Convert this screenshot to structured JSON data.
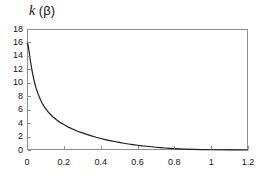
{
  "chart_data": {
    "type": "line",
    "title": "",
    "ylabel_parts": {
      "symbol": "k",
      "arg": " (β)"
    },
    "ylabel": "k (β)",
    "xlabel": "β",
    "xlim": [
      0,
      1.2
    ],
    "ylim": [
      0,
      18
    ],
    "grid": false,
    "legend": null,
    "xticks": [
      "0",
      "0.2",
      "0.4",
      "0.6",
      "0.8",
      "1",
      "1.2"
    ],
    "xtick_values": [
      0,
      0.2,
      0.4,
      0.6,
      0.8,
      1,
      1.2
    ],
    "yticks": [
      "0",
      "2",
      "4",
      "6",
      "8",
      "10",
      "12",
      "14",
      "16",
      "18"
    ],
    "ytick_values": [
      0,
      2,
      4,
      6,
      8,
      10,
      12,
      14,
      16,
      18
    ],
    "series": [
      {
        "name": "k(β)",
        "color": "#1a1a1a",
        "x": [
          0.0,
          0.005,
          0.01,
          0.015,
          0.02,
          0.03,
          0.04,
          0.05,
          0.06,
          0.07,
          0.08,
          0.09,
          0.1,
          0.12,
          0.14,
          0.16,
          0.18,
          0.2,
          0.225,
          0.25,
          0.275,
          0.3,
          0.325,
          0.35,
          0.375,
          0.4,
          0.425,
          0.45,
          0.475,
          0.5,
          0.525,
          0.55,
          0.575,
          0.6,
          0.625,
          0.65,
          0.675,
          0.7,
          0.725,
          0.75,
          0.775,
          0.8,
          0.85,
          0.9,
          0.95,
          1.0,
          1.1,
          1.2
        ],
        "y": [
          15.8,
          15.75,
          14.9,
          13.9,
          13.0,
          11.4,
          10.15,
          9.15,
          8.35,
          7.7,
          7.1,
          6.6,
          6.2,
          5.5,
          4.95,
          4.5,
          4.1,
          3.78,
          3.4,
          3.08,
          2.8,
          2.55,
          2.32,
          2.1,
          1.9,
          1.72,
          1.55,
          1.4,
          1.26,
          1.13,
          1.01,
          0.9,
          0.8,
          0.71,
          0.62,
          0.55,
          0.48,
          0.41,
          0.35,
          0.3,
          0.25,
          0.21,
          0.14,
          0.09,
          0.06,
          0.04,
          0.015,
          0.005
        ]
      }
    ]
  }
}
